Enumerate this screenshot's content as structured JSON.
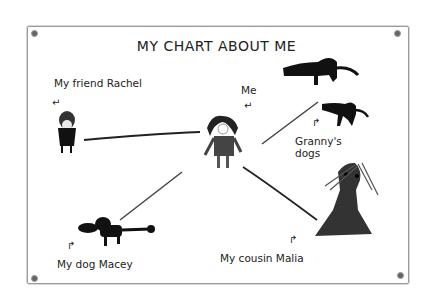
{
  "title": "MY CHART ABOUT ME",
  "labels": {
    "friend": "My friend Rachel",
    "me": "Me",
    "granny_dogs_line1": "Granny's",
    "granny_dogs_line2": "dogs",
    "dog": "My dog Macey",
    "cousin": "My cousin Malia"
  },
  "arrows": {
    "friend": "↵",
    "me": "↵",
    "granny": "↱",
    "dog": "↱",
    "cousin": "↱"
  },
  "colors": {
    "ink": "#111111",
    "frame": "#9a9a9a",
    "background": "#ffffff"
  }
}
